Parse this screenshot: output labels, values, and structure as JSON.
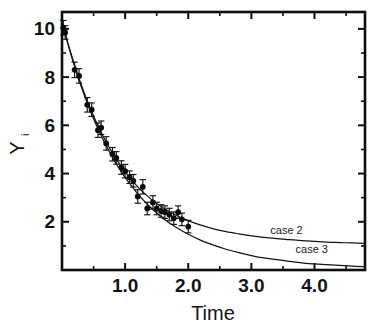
{
  "chart_data": {
    "type": "scatter",
    "title": "",
    "subtitle": "",
    "xlabel": "Time",
    "ylabel": "Y",
    "ylabel_subscript": "i",
    "xlim": [
      0.0,
      4.8
    ],
    "ylim": [
      0.0,
      10.7
    ],
    "grid": false,
    "legend_position": "inline-curve-labels",
    "xticks": [
      1.0,
      2.0,
      3.0,
      4.0
    ],
    "xtick_labels": [
      "1.0",
      "2.0",
      "3.0",
      "4.0"
    ],
    "xticks_minor": [
      0.5,
      1.5,
      2.5,
      3.5,
      4.5
    ],
    "yticks": [
      2,
      4,
      6,
      8,
      10
    ],
    "ytick_labels": [
      "2",
      "4",
      "6",
      "8",
      "10"
    ],
    "yticks_minor": [
      1,
      3,
      5,
      7,
      9
    ],
    "series": [
      {
        "name": "observed data",
        "type": "scatter-with-errorbars",
        "marker": "filled-circle",
        "x": [
          0.02,
          0.05,
          0.2,
          0.27,
          0.4,
          0.47,
          0.57,
          0.62,
          0.7,
          0.8,
          0.86,
          0.94,
          1.0,
          1.07,
          1.13,
          1.2,
          1.28,
          1.35,
          1.44,
          1.5,
          1.57,
          1.63,
          1.7,
          1.77,
          1.84,
          1.9,
          2.0
        ],
        "y": [
          10.05,
          9.85,
          8.3,
          8.05,
          6.85,
          6.65,
          5.8,
          5.9,
          5.25,
          4.8,
          4.65,
          4.25,
          4.1,
          3.85,
          3.7,
          3.05,
          3.45,
          2.55,
          2.8,
          2.55,
          2.45,
          2.4,
          2.3,
          2.15,
          2.4,
          2.1,
          1.8
        ],
        "yerr": [
          0.3,
          0.28,
          0.32,
          0.3,
          0.3,
          0.28,
          0.3,
          0.28,
          0.28,
          0.28,
          0.26,
          0.28,
          0.28,
          0.26,
          0.26,
          0.28,
          0.3,
          0.26,
          0.28,
          0.26,
          0.26,
          0.26,
          0.26,
          0.26,
          0.26,
          0.26,
          0.26
        ]
      },
      {
        "name": "case 2",
        "type": "line",
        "label": "case 2",
        "label_x": 3.3,
        "label_y": 1.5,
        "model": "decaying exponential with nonzero asymptote",
        "asymptote": 1.0,
        "x": [
          0.0,
          0.1,
          0.2,
          0.3,
          0.4,
          0.5,
          0.6,
          0.7,
          0.8,
          0.9,
          1.0,
          1.2,
          1.4,
          1.6,
          1.8,
          2.0,
          2.2,
          2.4,
          2.6,
          2.8,
          3.0,
          3.2,
          3.4,
          3.6,
          3.8,
          4.0,
          4.2,
          4.4,
          4.6,
          4.8
        ],
        "y": [
          10.3,
          9.35,
          8.5,
          7.72,
          7.02,
          6.39,
          5.82,
          5.31,
          4.85,
          4.44,
          4.07,
          3.45,
          2.96,
          2.58,
          2.28,
          2.05,
          1.86,
          1.71,
          1.59,
          1.5,
          1.42,
          1.35,
          1.3,
          1.26,
          1.22,
          1.19,
          1.16,
          1.14,
          1.12,
          1.1
        ]
      },
      {
        "name": "case 3",
        "type": "line",
        "label": "case 3",
        "label_x": 3.7,
        "label_y": 0.72,
        "model": "decaying exponential toward zero",
        "asymptote": 0.0,
        "x": [
          0.0,
          0.1,
          0.2,
          0.3,
          0.4,
          0.5,
          0.6,
          0.7,
          0.8,
          0.9,
          1.0,
          1.2,
          1.4,
          1.6,
          1.8,
          2.0,
          2.2,
          2.4,
          2.6,
          2.8,
          3.0,
          3.2,
          3.4,
          3.6,
          3.8,
          4.0,
          4.2,
          4.4,
          4.6,
          4.8
        ],
        "y": [
          10.3,
          9.32,
          8.44,
          7.64,
          6.92,
          6.27,
          5.68,
          5.15,
          4.67,
          4.23,
          3.84,
          3.16,
          2.6,
          2.15,
          1.78,
          1.48,
          1.23,
          1.03,
          0.86,
          0.72,
          0.6,
          0.5,
          0.43,
          0.36,
          0.3,
          0.25,
          0.22,
          0.19,
          0.16,
          0.14
        ]
      }
    ]
  },
  "axes": {
    "x_title": "Time",
    "y_title": "Y",
    "y_title_subscript": "i"
  },
  "colors": {
    "ink": "#131313",
    "curve": "#141414",
    "marker": "#0a0a0a",
    "background": "#ffffff"
  }
}
